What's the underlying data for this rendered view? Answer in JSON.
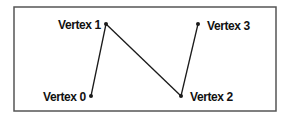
{
  "diagram": {
    "type": "polyline-vertices",
    "frame": {
      "x": 14,
      "y": 7,
      "width": 262,
      "height": 104,
      "stroke": "#555555"
    },
    "line_color": "#1a1a1a",
    "vertices": [
      {
        "id": 0,
        "label": "Vertex 0",
        "x": 91,
        "y": 96,
        "label_x": 43,
        "label_y": 101
      },
      {
        "id": 1,
        "label": "Vertex 1",
        "x": 106,
        "y": 24,
        "label_x": 58,
        "label_y": 29
      },
      {
        "id": 2,
        "label": "Vertex 2",
        "x": 181,
        "y": 96,
        "label_x": 190,
        "label_y": 101
      },
      {
        "id": 3,
        "label": "Vertex 3",
        "x": 198,
        "y": 24,
        "label_x": 207,
        "label_y": 30
      }
    ],
    "edges": [
      {
        "from": 0,
        "to": 1
      },
      {
        "from": 1,
        "to": 2
      },
      {
        "from": 2,
        "to": 3
      }
    ]
  }
}
